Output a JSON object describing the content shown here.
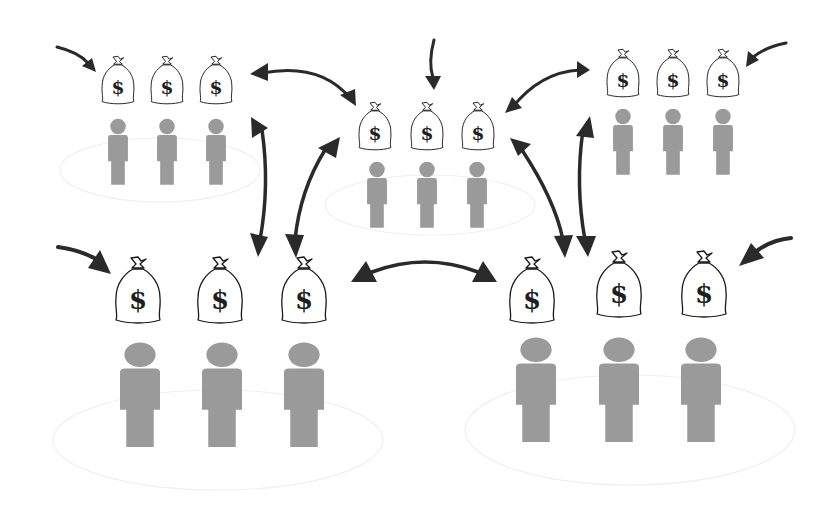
{
  "diagram": {
    "colors": {
      "background": "#ffffff",
      "person": "#9a9a9a",
      "arrow": "#2a2a2a",
      "bag_outline": "#1a1a1a",
      "ellipse": "#efefef"
    },
    "bag_symbol": "$",
    "groups": [
      {
        "id": "top-left",
        "label": "group-top-left",
        "scale": 0.8,
        "members": 3,
        "bags": 3
      },
      {
        "id": "top-center",
        "label": "group-top-center",
        "scale": 0.8,
        "members": 3,
        "bags": 3
      },
      {
        "id": "top-right",
        "label": "group-top-right",
        "scale": 0.8,
        "members": 3,
        "bags": 3
      },
      {
        "id": "bottom-left",
        "label": "group-bottom-left",
        "scale": 1.0,
        "members": 3,
        "bags": 3
      },
      {
        "id": "bottom-right",
        "label": "group-bottom-right",
        "scale": 1.0,
        "members": 3,
        "bags": 3
      }
    ],
    "exchange_arrows": [
      {
        "from": "top-left",
        "to": "top-center",
        "type": "bidirectional"
      },
      {
        "from": "top-right",
        "to": "top-center",
        "type": "bidirectional"
      },
      {
        "from": "top-left",
        "to": "bottom-left",
        "type": "bidirectional"
      },
      {
        "from": "top-center",
        "to": "bottom-left",
        "type": "bidirectional"
      },
      {
        "from": "top-center",
        "to": "bottom-right",
        "type": "bidirectional"
      },
      {
        "from": "top-right",
        "to": "bottom-right",
        "type": "bidirectional"
      },
      {
        "from": "bottom-left",
        "to": "bottom-right",
        "type": "bidirectional"
      }
    ],
    "inflow_arrows": [
      {
        "to": "top-left",
        "type": "inflow"
      },
      {
        "to": "top-center",
        "type": "inflow"
      },
      {
        "to": "top-right",
        "type": "inflow"
      },
      {
        "to": "bottom-left",
        "type": "inflow"
      },
      {
        "to": "bottom-right",
        "type": "inflow"
      }
    ]
  }
}
